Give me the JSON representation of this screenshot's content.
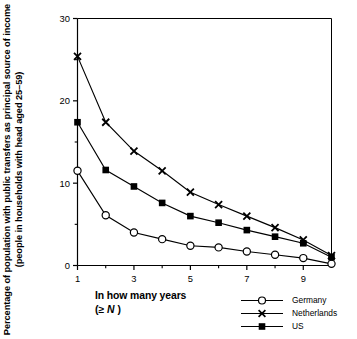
{
  "chart_data": {
    "type": "line",
    "title": "",
    "subtitle": "",
    "xlabel_line1": "In how many years",
    "xlabel_line2_prefix": "(≥ ",
    "xlabel_line2_var": "N",
    "xlabel_line2_suffix": " )",
    "ylabel": "Percentage of population with public transfers as principal source of income (people in households with head aged 25–59)",
    "x": [
      1,
      2,
      3,
      4,
      5,
      6,
      7,
      8,
      9,
      10
    ],
    "xlim": [
      1,
      10
    ],
    "ylim": [
      0,
      30
    ],
    "xticks_major": [
      1,
      3,
      5,
      7,
      9
    ],
    "xticks_major_labels": [
      "1",
      "3",
      "5",
      "7",
      "9"
    ],
    "xticks_minor": [
      2,
      4,
      6,
      8,
      10
    ],
    "yticks_major": [
      0,
      10,
      20,
      30
    ],
    "yticks_major_labels": [
      "0",
      "10",
      "20",
      "30"
    ],
    "yticks_minor": [
      5,
      15,
      25
    ],
    "grid": false,
    "legend_position": "bottom-right",
    "series": [
      {
        "name": "Germany",
        "marker": "open-circle",
        "color": "#000000",
        "values": [
          11.5,
          6.1,
          4.0,
          3.2,
          2.4,
          2.2,
          1.7,
          1.3,
          0.9,
          0.2
        ]
      },
      {
        "name": "Netherlands",
        "marker": "cross-x",
        "color": "#000000",
        "values": [
          25.4,
          17.4,
          13.9,
          11.5,
          8.9,
          7.4,
          6.0,
          4.6,
          3.1,
          1.2
        ]
      },
      {
        "name": "US",
        "marker": "filled-square",
        "color": "#000000",
        "values": [
          17.4,
          11.6,
          9.6,
          7.6,
          6.0,
          5.2,
          4.3,
          3.5,
          2.7,
          1.0
        ]
      }
    ]
  },
  "legend": {
    "items": [
      {
        "label": "Germany",
        "marker": "open-circle"
      },
      {
        "label": "Netherlands",
        "marker": "cross-x"
      },
      {
        "label": "US",
        "marker": "filled-square"
      }
    ]
  }
}
